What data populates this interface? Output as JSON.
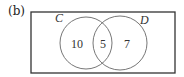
{
  "figure": {
    "part_label": "(b)",
    "type": "venn",
    "sets": [
      {
        "name": "C",
        "only": "10"
      },
      {
        "name": "D",
        "only": "7"
      }
    ],
    "intersection": "5",
    "colors": {
      "stroke": "#666666",
      "text": "#333333",
      "frame": "#333333"
    }
  }
}
